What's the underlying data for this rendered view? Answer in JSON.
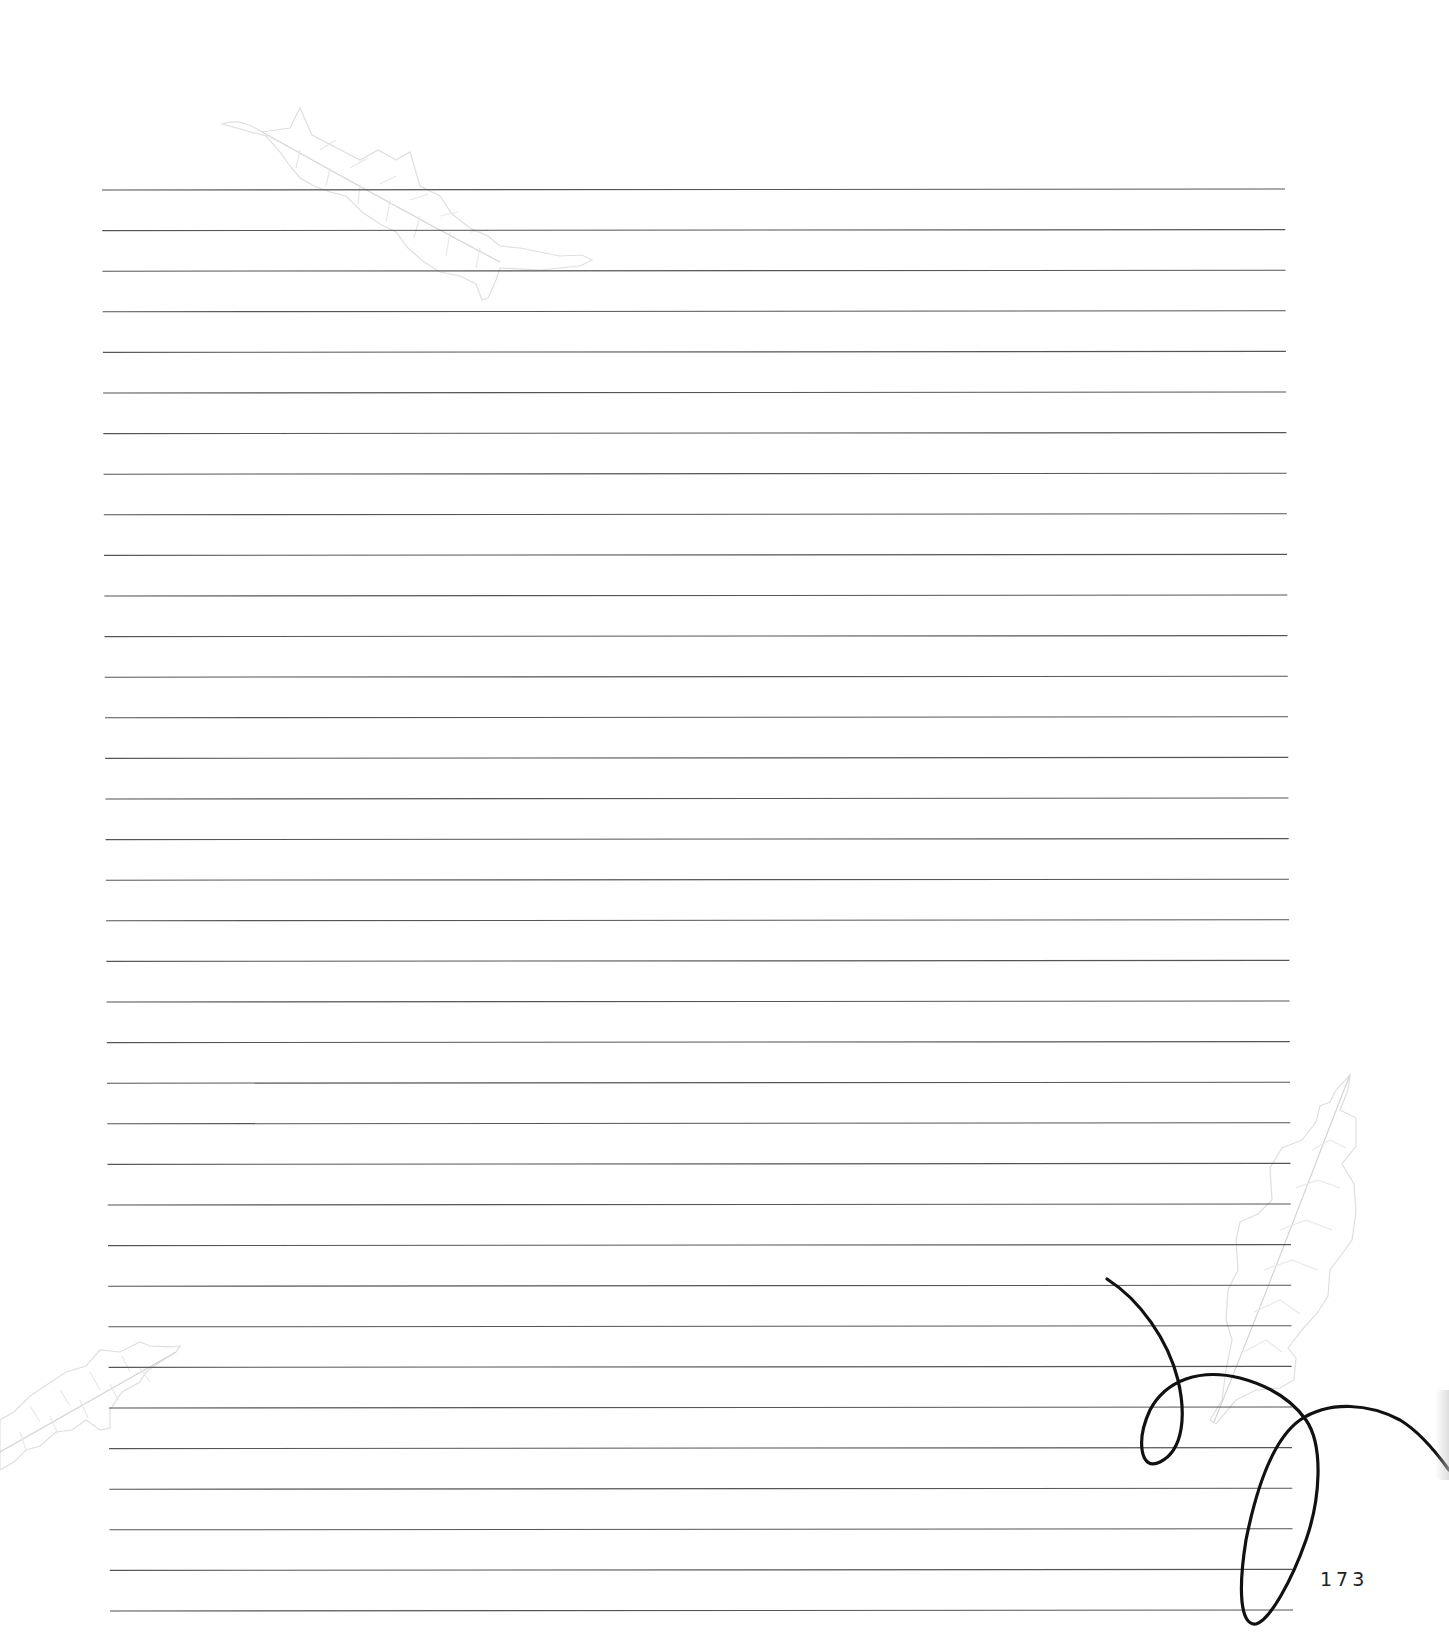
{
  "page": {
    "page_number": "173",
    "ruled_lines": {
      "count": 36,
      "first_y": 190,
      "spacing": 40.6,
      "x_start_top": 102,
      "x_end_top": 1285,
      "x_start_bottom": 110,
      "x_end_bottom": 1293,
      "color": "#555555"
    },
    "decorations": [
      {
        "type": "leaf-icon",
        "position": "top-left",
        "color": "#e4e4e4"
      },
      {
        "type": "leaf-icon",
        "position": "bottom-left",
        "color": "#e4e4e4"
      },
      {
        "type": "leaf-icon",
        "position": "right",
        "color": "#e4e4e4"
      },
      {
        "type": "swirl-flourish-icon",
        "position": "bottom-right",
        "color": "#111111"
      }
    ]
  }
}
